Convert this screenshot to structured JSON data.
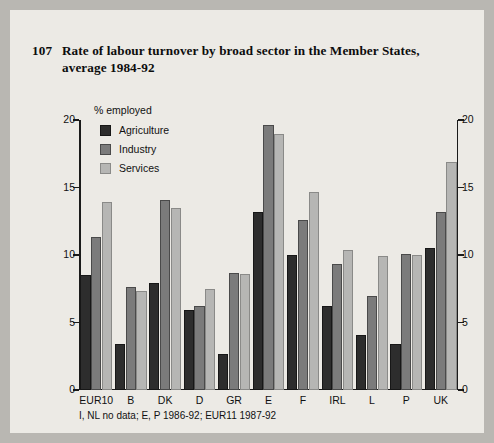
{
  "figure": {
    "number": "107",
    "title": "Rate of labour turnover by broad sector in the Member States, average 1984-92",
    "axis_caption": "% employed",
    "footnote": "I, NL no data; E, P 1986-92; EUR11 1987-92",
    "colors": {
      "agriculture": "#2d2d2d",
      "industry": "#7b7b7b",
      "services": "#b6b6b4",
      "background": "#eceae5",
      "page": "#b9b7b2",
      "axis": "#1b1b1b"
    }
  },
  "chart_data": {
    "type": "bar",
    "title": "Rate of labour turnover by broad sector in the Member States, average 1984-92",
    "xlabel": "",
    "ylabel": "% employed",
    "ylim": [
      0,
      20
    ],
    "yticks": [
      0,
      5,
      10,
      15,
      20
    ],
    "ytick_labels": [
      "0",
      "5",
      "10",
      "15",
      "20"
    ],
    "grid": false,
    "legend_position": "top-left",
    "categories": [
      "EUR10",
      "B",
      "DK",
      "D",
      "GR",
      "E",
      "F",
      "IRL",
      "L",
      "P",
      "UK"
    ],
    "series": [
      {
        "name": "Agriculture",
        "color": "#2d2d2d",
        "values": [
          8.5,
          3.4,
          7.9,
          5.9,
          2.7,
          13.2,
          10.0,
          6.2,
          4.1,
          3.4,
          10.5
        ]
      },
      {
        "name": "Industry",
        "color": "#7b7b7b",
        "values": [
          11.3,
          7.6,
          14.1,
          6.2,
          8.7,
          19.6,
          12.6,
          9.3,
          7.0,
          10.1,
          13.2
        ]
      },
      {
        "name": "Services",
        "color": "#b6b6b4",
        "values": [
          13.9,
          7.3,
          13.5,
          7.5,
          8.6,
          19.0,
          14.7,
          10.4,
          9.9,
          10.0,
          16.9
        ]
      }
    ],
    "annotations": [
      "I, NL no data; E, P 1986-92; EUR11 1987-92"
    ]
  }
}
